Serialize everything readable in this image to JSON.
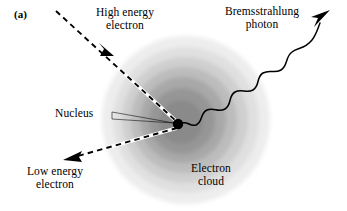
{
  "figure": {
    "panel_label": "(a)",
    "caption_subject": "Bremsstrahlung production diagram"
  },
  "labels": {
    "high_energy_electron": "High energy\nelectron",
    "bremsstrahlung_photon": "Bremsstrahlung\nphoton",
    "nucleus": "Nucleus",
    "low_energy_electron": "Low energy\nelectron",
    "electron_cloud": "Electron\ncloud"
  },
  "colors": {
    "background": "#ffffff",
    "ink": "#000000",
    "nucleus_fill": "#000000",
    "cloud_ring_1": "#ededed",
    "cloud_ring_2": "#dcdcdc",
    "cloud_ring_3": "#c8c8c8",
    "cloud_ring_4": "#b4b4b4",
    "cloud_ring_5": "#9e9e9e",
    "cloud_ring_6": "#8c8c8c",
    "cloud_ring_7": "#7d7d7d",
    "dash_highlight": "#ffffff"
  },
  "geometry": {
    "canvas_width": 347,
    "canvas_height": 211,
    "cloud_center_x": 186,
    "cloud_center_y": 120,
    "cloud_outer_radius": 84,
    "nucleus_x": 178,
    "nucleus_y": 124,
    "nucleus_radius": 5.2
  },
  "elements": {
    "incoming_electron_track": "dashed straight arrow entering from upper-left toward the nucleus",
    "outgoing_electron_track": "dashed straight arrow leaving toward lower-left",
    "photon_track": "sinusoidal wavy arrow leaving toward upper-right",
    "nucleus_leader": "thin wedge leader line from the Nucleus text to the black nucleus dot",
    "electron_cloud": "seven concentric shaded rings representing the atomic electron cloud"
  }
}
